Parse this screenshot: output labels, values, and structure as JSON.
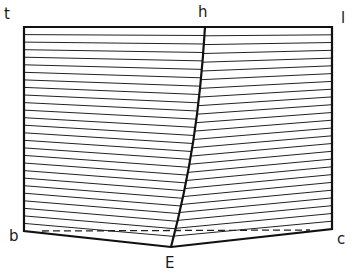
{
  "diagram": {
    "labels": {
      "top_left": "t",
      "top_mid": "h",
      "top_right": "l",
      "bottom_left": "b",
      "bottom_mid": "E",
      "bottom_right": "c"
    },
    "points": {
      "t": [
        24,
        27
      ],
      "h": [
        205,
        27
      ],
      "l": [
        332,
        27
      ],
      "b": [
        24,
        231
      ],
      "E": [
        171,
        247
      ],
      "c": [
        332,
        229
      ]
    },
    "midline_curve": "M205,27 C200,110 190,175 171,247",
    "dashed_line": [
      [
        42,
        231
      ],
      [
        310,
        230
      ]
    ],
    "left_hatch_count": 27,
    "right_hatch_count": 26,
    "colors": {
      "stroke": "#111111",
      "background": "#ffffff"
    }
  }
}
